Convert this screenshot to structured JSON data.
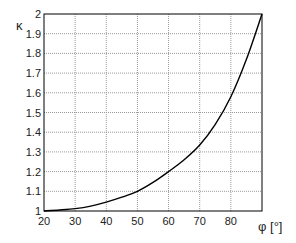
{
  "chart_data": {
    "type": "line",
    "title": "",
    "xlabel": "φ [°]",
    "ylabel": "κ",
    "xlim": [
      20,
      90
    ],
    "ylim": [
      1,
      2
    ],
    "grid": true,
    "legend": null,
    "x_ticks": [
      "20",
      "30",
      "40",
      "50",
      "60",
      "70",
      "80"
    ],
    "y_ticks": [
      "1",
      "1.1",
      "1.2",
      "1.3",
      "1.4",
      "1.5",
      "1.6",
      "1.7",
      "1.8",
      "1.9",
      "2"
    ],
    "series": [
      {
        "name": "κ(φ)",
        "color": "#000000",
        "x": [
          20,
          25,
          30,
          35,
          40,
          45,
          50,
          55,
          60,
          65,
          70,
          75,
          80,
          85,
          90
        ],
        "values": [
          1.0,
          1.005,
          1.012,
          1.025,
          1.045,
          1.07,
          1.1,
          1.145,
          1.2,
          1.26,
          1.335,
          1.44,
          1.58,
          1.77,
          2.0
        ]
      }
    ]
  }
}
